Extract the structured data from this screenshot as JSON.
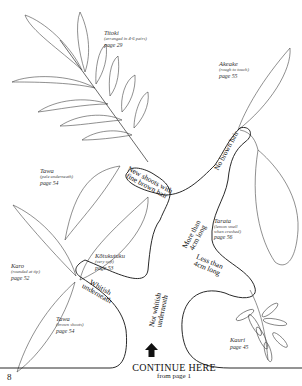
{
  "page": {
    "number": "8"
  },
  "continue": {
    "title": "CONTINUE HERE",
    "subtitle": "from page 1",
    "icon": "up-arrow-icon"
  },
  "branches": {
    "new_shoots": {
      "line1": "New shoots with",
      "line2": "fine brown hair"
    },
    "no_brown_hair": "No brown hair",
    "more_than": {
      "line1": "More than",
      "line2": "4cm long"
    },
    "less_than": {
      "line1": "Less than",
      "line2": "4cm long"
    },
    "whitish": {
      "line1": "Whitish",
      "line2": "underneath"
    },
    "not_whitish": {
      "line1": "Not whitish",
      "line2": "underneath"
    }
  },
  "plants": [
    {
      "name": "Titoki",
      "note": "(arranged in 4-6 pairs)",
      "page": "page 29"
    },
    {
      "name": "Akeake",
      "note": "(rough to touch)",
      "page": "page 55"
    },
    {
      "name": "Tawa",
      "note": "(pale underneath)",
      "page": "page 54"
    },
    {
      "name": "Tarata",
      "note": "(lemon smell",
      "note2": "when crushed)",
      "page": "page 56"
    },
    {
      "name": "Kōtukutuku",
      "note": "(very soft)",
      "page": "page 53"
    },
    {
      "name": "Karo",
      "note": "(rounded at tip)",
      "page": "page 52"
    },
    {
      "name": "Tawa",
      "note": "(brown shoots)",
      "page": "page 54"
    },
    {
      "name": "Kauri",
      "page": "page 45"
    }
  ]
}
